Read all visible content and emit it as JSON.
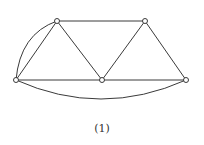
{
  "figure": {
    "caption": "(1)",
    "colors": {
      "stroke": "#3a3a3a",
      "background": "#ffffff"
    },
    "vertices": [
      {
        "id": "top-left",
        "x": 57,
        "y": 21
      },
      {
        "id": "top-right",
        "x": 145,
        "y": 21
      },
      {
        "id": "left",
        "x": 16,
        "y": 80
      },
      {
        "id": "middle",
        "x": 102,
        "y": 80
      },
      {
        "id": "right",
        "x": 186,
        "y": 80
      }
    ],
    "edges": [
      [
        "top-left",
        "top-right"
      ],
      [
        "top-left",
        "left"
      ],
      [
        "top-left",
        "middle"
      ],
      [
        "top-right",
        "middle"
      ],
      [
        "top-right",
        "right"
      ],
      [
        "left",
        "middle"
      ],
      [
        "middle",
        "right"
      ]
    ],
    "curved_edges": [
      {
        "from": "left",
        "to": "top-left",
        "note": "arc bulging outward (multi-edge)"
      },
      {
        "from": "left",
        "to": "right",
        "note": "arc below baseline"
      }
    ]
  }
}
